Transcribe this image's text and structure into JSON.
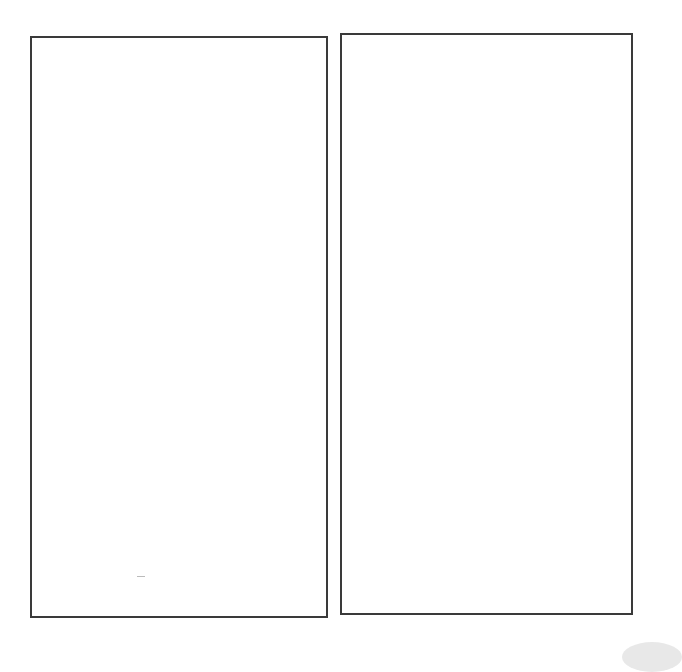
{
  "panels": [
    {
      "id": "left",
      "content": ""
    },
    {
      "id": "right",
      "content": ""
    }
  ],
  "colors": {
    "border": "#3a3a3a",
    "background": "#ffffff"
  }
}
